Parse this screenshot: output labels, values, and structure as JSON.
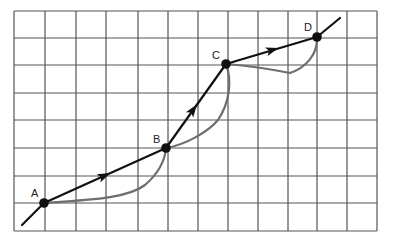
{
  "diagram": {
    "type": "path-on-grid",
    "grid": {
      "x_lines": [
        14,
        45,
        76,
        106,
        138,
        168,
        198,
        228,
        258,
        288,
        317,
        347,
        377
      ],
      "y_lines": [
        11,
        38,
        65,
        93,
        120,
        148,
        176,
        203,
        231
      ],
      "columns": 12,
      "rows": 8,
      "line_color": "#555555"
    },
    "points": [
      {
        "id": "A",
        "label": "A",
        "x": 44,
        "y": 203,
        "label_x": 31,
        "label_y": 197
      },
      {
        "id": "B",
        "label": "B",
        "x": 166,
        "y": 148,
        "label_x": 153,
        "label_y": 143
      },
      {
        "id": "C",
        "label": "C",
        "x": 226,
        "y": 64,
        "label_x": 212,
        "label_y": 59
      },
      {
        "id": "D",
        "label": "D",
        "x": 317,
        "y": 37,
        "label_x": 304,
        "label_y": 31
      }
    ],
    "straight_path": {
      "color": "#111111",
      "start": {
        "x": 22,
        "y": 225
      },
      "end": {
        "x": 340,
        "y": 18
      },
      "arrows": [
        {
          "segment": "AB",
          "x": 104,
          "y": 176
        },
        {
          "segment": "BC",
          "x": 193,
          "y": 110
        },
        {
          "segment": "CD",
          "x": 272,
          "y": 50
        }
      ]
    },
    "curved_path": {
      "color": "#6e6e6e",
      "segments": [
        {
          "from": "A",
          "to": "B",
          "d": "M44,203 C80,200 125,200 145,185 C160,172 165,160 166,148"
        },
        {
          "from": "B",
          "to": "C",
          "d": "M166,148 C185,145 208,132 218,120 C230,102 232,80 226,64"
        },
        {
          "from": "C",
          "to": "D",
          "d": "M226,64 C250,66 275,70 290,73 C305,68 318,55 317,37"
        }
      ]
    }
  }
}
